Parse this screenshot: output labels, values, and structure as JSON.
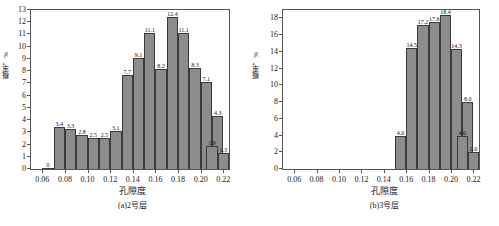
{
  "figure": {
    "ylabel": "概率，%",
    "xlabel": "孔隙度",
    "bar_color": "#8c8c8c",
    "edge_color": "#3a3a3a",
    "axis_color": "#555555"
  },
  "chart_data": [
    {
      "type": "bar",
      "title": "(a)2号层",
      "xlabel": "孔隙度",
      "ylabel": "概率，%",
      "xlim": [
        0.05,
        0.225
      ],
      "ylim": [
        0,
        13
      ],
      "xticks": [
        "0.06",
        "0.08",
        "0.10",
        "0.12",
        "0.14",
        "0.16",
        "0.18",
        "0.20",
        "0.22"
      ],
      "xtick_values": [
        0.06,
        0.08,
        0.1,
        0.12,
        0.14,
        0.16,
        0.18,
        0.2,
        0.22
      ],
      "yticks": [
        "0",
        "1",
        "2",
        "3",
        "4",
        "5",
        "6",
        "7",
        "8",
        "9",
        "10",
        "11",
        "12",
        "13"
      ],
      "ytick_values": [
        0,
        1,
        2,
        3,
        4,
        5,
        6,
        7,
        8,
        9,
        10,
        11,
        12,
        13
      ],
      "bin_width": 0.01,
      "bin_starts": [
        0.06,
        0.07,
        0.08,
        0.09,
        0.1,
        0.11,
        0.12,
        0.13,
        0.14,
        0.15,
        0.16,
        0.17,
        0.18,
        0.19,
        0.2,
        0.21
      ],
      "values": [
        0,
        3.4,
        3.3,
        2.8,
        2.5,
        2.5,
        3.1,
        7.7,
        9.1,
        11.1,
        8.2,
        12.4,
        11.1,
        8.3,
        7.1,
        4.3
      ],
      "labels": [
        "0",
        "3.4",
        "3.3",
        "2.8",
        "2.5",
        "2.5",
        "3.1",
        "7.7",
        "9.1",
        "11.1",
        "8.2",
        "12.4",
        "11.1",
        "8.3",
        "7.1",
        "4.3"
      ],
      "extra_bins": [
        {
          "start": 0.205,
          "value": 1.9,
          "label": "1.9"
        },
        {
          "start": 0.215,
          "value": 1.3,
          "label": "1.3"
        }
      ],
      "grid": false,
      "legend": "none"
    },
    {
      "type": "bar",
      "title": "(b)3号层",
      "xlabel": "孔隙度",
      "ylabel": "概率，%",
      "xlim": [
        0.05,
        0.225
      ],
      "ylim": [
        0,
        19
      ],
      "xticks": [
        "0.06",
        "0.08",
        "0.10",
        "0.12",
        "0.14",
        "0.16",
        "0.18",
        "0.20",
        "0.22"
      ],
      "xtick_values": [
        0.06,
        0.08,
        0.1,
        0.12,
        0.14,
        0.16,
        0.18,
        0.2,
        0.22
      ],
      "yticks": [
        "0",
        "2",
        "4",
        "6",
        "8",
        "10",
        "12",
        "14",
        "16",
        "18"
      ],
      "ytick_values": [
        0,
        2,
        4,
        6,
        8,
        10,
        12,
        14,
        16,
        18
      ],
      "bin_width": 0.01,
      "bin_starts": [
        0.15,
        0.16,
        0.17,
        0.18,
        0.19,
        0.2,
        0.21
      ],
      "values": [
        4.0,
        14.5,
        17.2,
        17.6,
        18.4,
        14.3,
        8.0
      ],
      "labels": [
        "4.0",
        "14.5",
        "17.2",
        "17.6",
        "18.4",
        "14.3",
        "8.0"
      ],
      "extra_bins": [
        {
          "start": 0.205,
          "value": 4.0,
          "label": "4.0"
        },
        {
          "start": 0.215,
          "value": 2.0,
          "label": "2.0"
        }
      ],
      "grid": false,
      "legend": "none"
    }
  ]
}
